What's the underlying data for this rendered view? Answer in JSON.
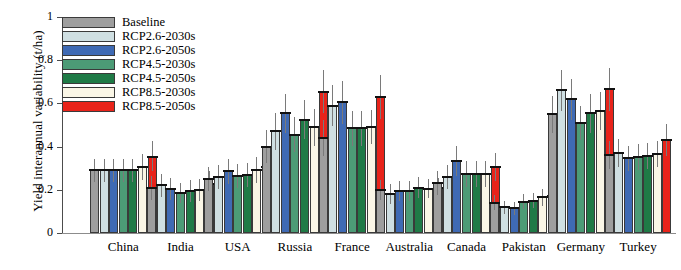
{
  "chart_data": {
    "type": "bar",
    "title": "",
    "xlabel": "",
    "ylabel": "Yield interannual variability (t/ha)",
    "ylim": [
      0,
      1
    ],
    "yticks": [
      "0",
      "0.2",
      "0.4",
      "0.6",
      "0.8",
      "1"
    ],
    "ytick_values": [
      0,
      0.2,
      0.4,
      0.6,
      0.8,
      1
    ],
    "grid": false,
    "legend_position": "top-left",
    "categories": [
      "China",
      "India",
      "USA",
      "Russia",
      "France",
      "Australia",
      "Canada",
      "Pakistan",
      "Germany",
      "Turkey"
    ],
    "series": [
      {
        "name": "Baseline",
        "color": "#9e9e9e",
        "values": [
          0.29,
          0.21,
          0.25,
          0.4,
          0.44,
          0.2,
          0.23,
          0.14,
          0.55,
          0.36
        ],
        "err_low": [
          0.235,
          0.155,
          0.195,
          0.325,
          0.355,
          0.155,
          0.175,
          0.105,
          0.465,
          0.295
        ],
        "err_high": [
          0.345,
          0.265,
          0.305,
          0.475,
          0.525,
          0.245,
          0.285,
          0.175,
          0.635,
          0.425
        ]
      },
      {
        "name": "RCP2.6-2030s",
        "color": "#cfdfe2",
        "values": [
          0.29,
          0.22,
          0.26,
          0.47,
          0.59,
          0.18,
          0.26,
          0.12,
          0.66,
          0.37
        ],
        "err_low": [
          0.235,
          0.165,
          0.205,
          0.385,
          0.495,
          0.135,
          0.205,
          0.09,
          0.565,
          0.305
        ],
        "err_high": [
          0.345,
          0.275,
          0.315,
          0.555,
          0.685,
          0.225,
          0.315,
          0.15,
          0.755,
          0.435
        ]
      },
      {
        "name": "RCP2.6-2050s",
        "color": "#3f6ab4",
        "values": [
          0.29,
          0.205,
          0.285,
          0.555,
          0.605,
          0.195,
          0.335,
          0.115,
          0.62,
          0.345
        ],
        "err_low": [
          0.235,
          0.155,
          0.225,
          0.465,
          0.505,
          0.15,
          0.265,
          0.085,
          0.525,
          0.285
        ],
        "err_high": [
          0.345,
          0.255,
          0.345,
          0.645,
          0.705,
          0.24,
          0.405,
          0.145,
          0.715,
          0.405
        ]
      },
      {
        "name": "RCP4.5-2030s",
        "color": "#4c9b76",
        "values": [
          0.29,
          0.185,
          0.265,
          0.455,
          0.485,
          0.195,
          0.275,
          0.145,
          0.51,
          0.35
        ],
        "err_low": [
          0.235,
          0.14,
          0.21,
          0.375,
          0.405,
          0.15,
          0.215,
          0.11,
          0.43,
          0.29
        ],
        "err_high": [
          0.345,
          0.23,
          0.32,
          0.535,
          0.565,
          0.24,
          0.335,
          0.18,
          0.59,
          0.41
        ]
      },
      {
        "name": "RCP4.5-2050s",
        "color": "#1f7a46",
        "values": [
          0.29,
          0.195,
          0.27,
          0.525,
          0.485,
          0.21,
          0.275,
          0.15,
          0.555,
          0.355
        ],
        "err_low": [
          0.235,
          0.145,
          0.215,
          0.435,
          0.405,
          0.16,
          0.215,
          0.115,
          0.465,
          0.295
        ],
        "err_high": [
          0.345,
          0.245,
          0.325,
          0.615,
          0.565,
          0.26,
          0.335,
          0.185,
          0.645,
          0.415
        ]
      },
      {
        "name": "RCP8.5-2030s",
        "color": "#faf6e6",
        "values": [
          0.305,
          0.2,
          0.29,
          0.49,
          0.49,
          0.205,
          0.275,
          0.165,
          0.565,
          0.365
        ],
        "err_low": [
          0.245,
          0.15,
          0.23,
          0.405,
          0.41,
          0.16,
          0.215,
          0.125,
          0.475,
          0.305
        ],
        "err_high": [
          0.365,
          0.25,
          0.35,
          0.575,
          0.57,
          0.25,
          0.335,
          0.205,
          0.655,
          0.425
        ]
      },
      {
        "name": "RCP8.5-2050s",
        "color": "#e8231a",
        "values": [
          0.35,
          0.225,
          0.305,
          0.655,
          0.63,
          0.21,
          0.305,
          0.17,
          0.665,
          0.43
        ],
        "err_low": [
          0.285,
          0.17,
          0.24,
          0.555,
          0.53,
          0.165,
          0.24,
          0.13,
          0.565,
          0.355
        ],
        "err_high": [
          0.425,
          0.285,
          0.37,
          0.755,
          0.73,
          0.255,
          0.37,
          0.21,
          0.765,
          0.505
        ]
      }
    ]
  }
}
